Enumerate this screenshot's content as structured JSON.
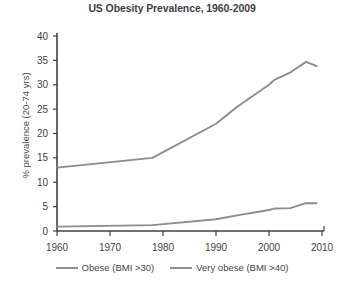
{
  "chart_data": {
    "type": "line",
    "title": "US Obesity Prevalence, 1960-2009",
    "xlabel": "",
    "ylabel": "% prevalence (20-74 yrs)",
    "xlim": [
      1960,
      2010
    ],
    "ylim": [
      0,
      40
    ],
    "xticks": [
      1960,
      1970,
      1980,
      1990,
      2000,
      2010
    ],
    "yticks": [
      0,
      5,
      10,
      15,
      20,
      25,
      30,
      35,
      40
    ],
    "grid": false,
    "legend_position": "bottom",
    "series": [
      {
        "name": "Obese (BMI >30)",
        "color": "#8c8c8c",
        "x": [
          1960,
          1978,
          1990,
          1994,
          2000,
          2001,
          2004,
          2007,
          2009
        ],
        "values": [
          13.0,
          15.0,
          22.0,
          25.5,
          30.0,
          31.0,
          32.5,
          34.7,
          33.8
        ]
      },
      {
        "name": "Very obese (BMI >40)",
        "color": "#8c8c8c",
        "x": [
          1960,
          1978,
          1990,
          1994,
          2000,
          2001,
          2004,
          2007,
          2009
        ],
        "values": [
          0.9,
          1.2,
          2.4,
          3.2,
          4.3,
          4.6,
          4.7,
          5.7,
          5.7
        ]
      }
    ]
  },
  "legend": {
    "items": [
      {
        "label": "Obese (BMI >30)",
        "color": "#8c8c8c"
      },
      {
        "label": "Very obese (BMI >40)",
        "color": "#8c8c8c"
      }
    ]
  },
  "axis": {
    "y_tick_labels": [
      "40",
      "35",
      "30",
      "25",
      "20",
      "15",
      "10",
      "5",
      "0"
    ],
    "x_tick_labels": [
      "1960",
      "1970",
      "1980",
      "1990",
      "2000",
      "2010"
    ]
  }
}
